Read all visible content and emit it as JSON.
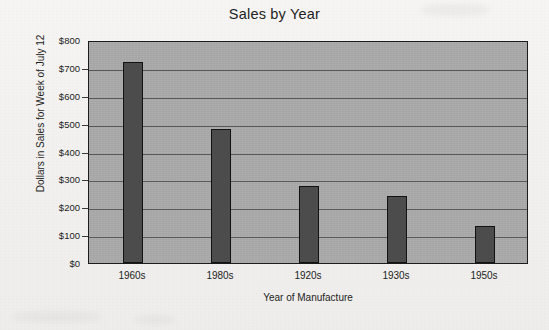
{
  "chart_data": {
    "type": "bar",
    "title": "Sales by Year",
    "xlabel": "Year of Manufacture",
    "ylabel": "Dollars in Sales for Week of July 12",
    "categories": [
      "1960s",
      "1980s",
      "1920s",
      "1930s",
      "1950s"
    ],
    "values": [
      720,
      480,
      275,
      240,
      133
    ],
    "ylim": [
      0,
      800
    ],
    "ytick_values": [
      0,
      100,
      200,
      300,
      400,
      500,
      600,
      700,
      800
    ],
    "ytick_labels": [
      "$0",
      "$100",
      "$200",
      "$300",
      "$400",
      "$500",
      "$600",
      "$700",
      "$800"
    ],
    "grid": true,
    "legend": false,
    "colors": {
      "bar_fill": "#4c4c4c",
      "bar_edge": "#121212",
      "plot_background": "#a9a9a9",
      "gridline": "#595959",
      "page_background": "#f3f2f0",
      "text": "#1d1d1d"
    }
  }
}
